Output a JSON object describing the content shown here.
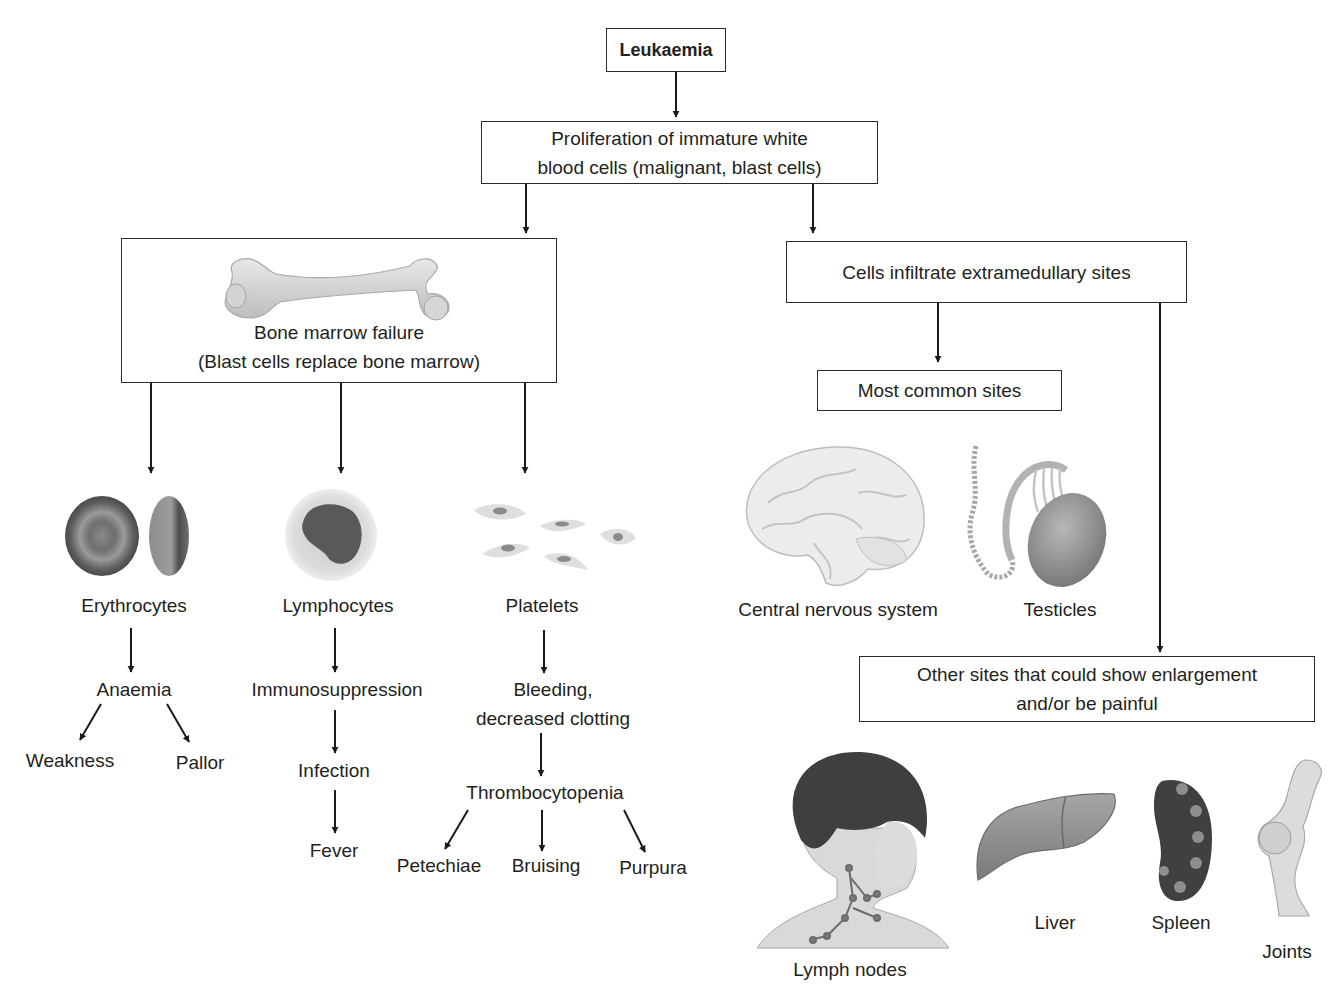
{
  "title": "Leukaemia",
  "nodes": {
    "proliferation": [
      "Proliferation of immature white",
      "blood cells (malignant, blast cells)"
    ],
    "bone_marrow": [
      "Bone marrow failure",
      "(Blast cells replace bone marrow)"
    ],
    "infiltrate": "Cells infiltrate extramedullary sites",
    "common_sites": "Most common sites",
    "other_sites": [
      "Other sites that could show enlargement",
      "and/or be painful"
    ]
  },
  "branches": {
    "erythrocytes": {
      "label": "Erythrocytes",
      "effect": "Anaemia",
      "symptoms": [
        "Weakness",
        "Pallor"
      ]
    },
    "lymphocytes": {
      "label": "Lymphocytes",
      "chain": [
        "Immunosuppression",
        "Infection",
        "Fever"
      ]
    },
    "platelets": {
      "label": "Platelets",
      "effect": [
        "Bleeding,",
        "decreased clotting"
      ],
      "condition": "Thrombocytopenia",
      "symptoms": [
        "Petechiae",
        "Bruising",
        "Purpura"
      ]
    }
  },
  "common_sites_list": [
    "Central nervous system",
    "Testicles"
  ],
  "other_sites_list": [
    "Lymph nodes",
    "Liver",
    "Spleen",
    "Joints"
  ],
  "illustrations": [
    "femur-bone",
    "red-blood-cells",
    "lymphocyte-cell",
    "platelets",
    "brain",
    "testicle",
    "child-head-lymph-nodes",
    "liver",
    "spleen",
    "knee-joint"
  ]
}
